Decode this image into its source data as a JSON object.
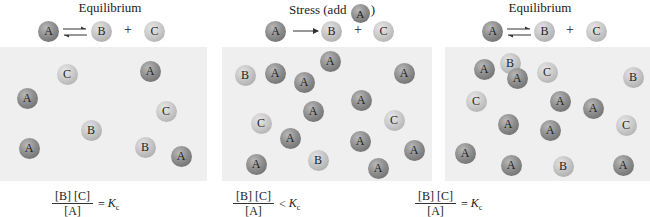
{
  "panels": [
    {
      "title": "Equilibrium",
      "reaction": {
        "reactant": "A",
        "arrow": "equilibrium",
        "product1": "B",
        "plus": "+",
        "product2": "C"
      },
      "particles": [
        "C",
        "A",
        "A",
        "C",
        "B",
        "A",
        "B",
        "A"
      ],
      "formula": {
        "numerator": "[B] [C]",
        "denominator": "[A]",
        "relation": "=",
        "constant": "K",
        "subscript": "c"
      }
    },
    {
      "title_prefix": "Stress (add",
      "title_molecule": "A",
      "title_suffix": ")",
      "reaction": {
        "reactant": "A",
        "arrow": "forward",
        "product1": "B",
        "plus": "+",
        "product2": "C"
      },
      "particles": [
        "B",
        "A",
        "A",
        "A",
        "A",
        "A",
        "A",
        "C",
        "A",
        "C",
        "A",
        "A",
        "A",
        "B",
        "A"
      ],
      "formula": {
        "numerator": "[B] [C]",
        "denominator": "[A]",
        "relation": "<",
        "constant": "K",
        "subscript": "c"
      }
    },
    {
      "title": "Equilibrium",
      "reaction": {
        "reactant": "A",
        "arrow": "equilibrium",
        "product1": "B",
        "plus": "+",
        "product2": "C"
      },
      "particles": [
        "A",
        "B",
        "A",
        "C",
        "B",
        "C",
        "A",
        "A",
        "A",
        "A",
        "C",
        "A",
        "A",
        "B",
        "A"
      ],
      "formula": {
        "numerator": "[B] [C]",
        "denominator": "[A]",
        "relation": "=",
        "constant": "K",
        "subscript": "c"
      }
    }
  ],
  "colors": {
    "panel_bg": "#efefef",
    "molecule_A": "#8e8e8e",
    "molecule_B": "#c2c2c2",
    "molecule_C": "#c8c8c8"
  }
}
